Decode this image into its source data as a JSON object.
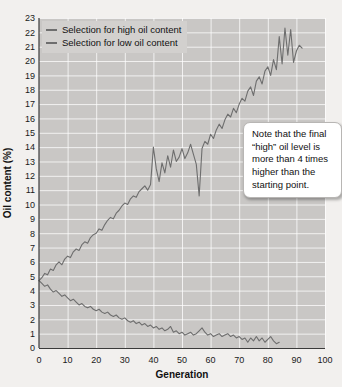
{
  "chart_data": {
    "type": "line",
    "title": "",
    "xlabel": "Generation",
    "ylabel": "Oil content (%)",
    "xlim": [
      0,
      100
    ],
    "ylim": [
      0,
      23
    ],
    "xticks": [
      0,
      10,
      20,
      30,
      40,
      50,
      60,
      70,
      80,
      90,
      100
    ],
    "yticks": [
      0,
      1,
      2,
      3,
      4,
      5,
      6,
      7,
      8,
      9,
      10,
      11,
      12,
      13,
      14,
      15,
      16,
      17,
      18,
      19,
      20,
      21,
      22,
      23
    ],
    "grid": true,
    "legend_position": "top-left",
    "line_color": "#6e6e6e",
    "plot_bg_color": "#c9c7c5",
    "page_bg_color": "#f2f0ee",
    "series": [
      {
        "name": "Selection for high oil content",
        "x": [
          0,
          1,
          2,
          3,
          4,
          5,
          6,
          7,
          8,
          9,
          10,
          11,
          12,
          13,
          14,
          15,
          16,
          17,
          18,
          19,
          20,
          21,
          22,
          23,
          24,
          25,
          26,
          27,
          28,
          29,
          30,
          31,
          32,
          33,
          34,
          35,
          36,
          37,
          38,
          39,
          40,
          41,
          42,
          43,
          44,
          45,
          46,
          47,
          48,
          49,
          50,
          51,
          52,
          53,
          54,
          55,
          56,
          57,
          58,
          59,
          60,
          61,
          62,
          63,
          64,
          65,
          66,
          67,
          68,
          69,
          70,
          71,
          72,
          73,
          74,
          75,
          76,
          77,
          78,
          79,
          80,
          81,
          82,
          83,
          84,
          85,
          86,
          87,
          88,
          89,
          90,
          91,
          92
        ],
        "values": [
          4.7,
          4.9,
          5.2,
          5.1,
          5.5,
          5.4,
          5.8,
          6.0,
          5.8,
          6.2,
          6.4,
          6.3,
          6.7,
          6.9,
          6.8,
          7.2,
          7.4,
          7.3,
          7.7,
          7.9,
          8.0,
          8.3,
          8.2,
          8.6,
          8.9,
          9.1,
          9.0,
          9.4,
          9.6,
          9.9,
          10.1,
          10.0,
          10.4,
          10.6,
          10.5,
          10.9,
          11.1,
          11.3,
          11.0,
          11.4,
          14.0,
          12.5,
          11.6,
          12.9,
          12.2,
          13.4,
          12.6,
          13.8,
          13.0,
          13.3,
          13.9,
          13.2,
          13.6,
          14.2,
          13.5,
          12.8,
          10.6,
          13.9,
          14.4,
          14.2,
          14.9,
          14.6,
          15.2,
          15.6,
          15.3,
          15.9,
          16.3,
          16.1,
          16.7,
          16.4,
          17.0,
          17.4,
          17.2,
          17.9,
          18.2,
          17.6,
          18.6,
          18.9,
          18.4,
          19.3,
          19.6,
          19.0,
          20.1,
          19.4,
          21.7,
          19.8,
          22.3,
          20.4,
          22.2,
          19.9,
          20.7,
          21.1,
          20.9
        ]
      },
      {
        "name": "Selection for low oil content",
        "x": [
          0,
          1,
          2,
          3,
          4,
          5,
          6,
          7,
          8,
          9,
          10,
          11,
          12,
          13,
          14,
          15,
          16,
          17,
          18,
          19,
          20,
          21,
          22,
          23,
          24,
          25,
          26,
          27,
          28,
          29,
          30,
          31,
          32,
          33,
          34,
          35,
          36,
          37,
          38,
          39,
          40,
          41,
          42,
          43,
          44,
          45,
          46,
          47,
          48,
          49,
          50,
          51,
          52,
          53,
          54,
          55,
          56,
          57,
          58,
          59,
          60,
          61,
          62,
          63,
          64,
          65,
          66,
          67,
          68,
          69,
          70,
          71,
          72,
          73,
          74,
          75,
          76,
          77,
          78,
          79,
          80,
          81,
          82,
          83,
          84
        ],
        "values": [
          4.7,
          4.5,
          4.3,
          4.4,
          4.1,
          3.9,
          4.0,
          3.8,
          3.6,
          3.7,
          3.5,
          3.3,
          3.4,
          3.2,
          3.0,
          3.1,
          2.9,
          2.8,
          2.9,
          2.7,
          2.6,
          2.7,
          2.5,
          2.4,
          2.5,
          2.3,
          2.2,
          2.3,
          2.1,
          2.0,
          2.1,
          1.9,
          1.8,
          1.9,
          1.7,
          1.8,
          1.6,
          1.7,
          1.5,
          1.6,
          1.4,
          1.5,
          1.3,
          1.4,
          1.2,
          1.3,
          1.5,
          1.1,
          1.2,
          1.0,
          1.1,
          0.9,
          1.0,
          1.1,
          0.9,
          1.0,
          1.2,
          1.4,
          1.1,
          0.9,
          1.0,
          0.8,
          0.9,
          1.0,
          0.8,
          0.9,
          1.0,
          0.8,
          0.9,
          0.7,
          0.8,
          0.6,
          0.7,
          0.4,
          0.7,
          0.5,
          0.8,
          0.5,
          0.7,
          0.4,
          0.6,
          0.8,
          0.5,
          0.3,
          0.4
        ]
      }
    ],
    "annotations": [
      {
        "text": "Note that the final “high” oil level is more than 4 times higher than the starting point."
      }
    ]
  },
  "legend": {
    "items": [
      {
        "label": "Selection for high oil content"
      },
      {
        "label": "Selection for low oil content"
      }
    ]
  }
}
